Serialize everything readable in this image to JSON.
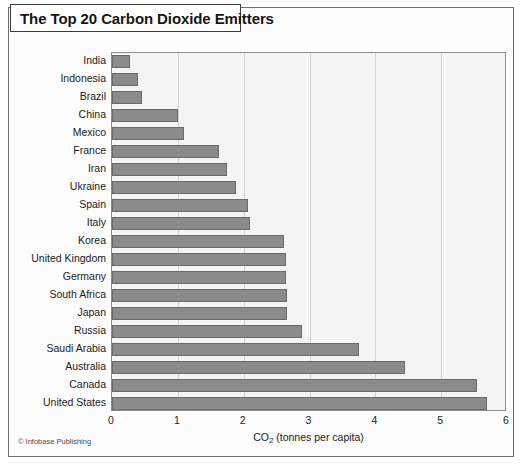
{
  "figure": {
    "title": "The Top 20 Carbon Dioxide Emitters",
    "credit": "© Infobase Publishing"
  },
  "colors": {
    "bar_fill": "#8b8b8b",
    "bar_border": "#6b6b6b",
    "plot_background": "#f4f4f4",
    "gridline": "#d3d3d3",
    "frame_border": "#6f6f6f",
    "title_border": "#3b3b3b",
    "text": "#1b1b1b"
  },
  "chart_data": {
    "type": "bar",
    "orientation": "horizontal",
    "title": "The Top 20 Carbon Dioxide Emitters",
    "xlabel": "CO2 (tonnes per capita)",
    "xlabel_parts": {
      "prefix": "CO",
      "subscript": "2",
      "suffix": " (tonnes per capita)"
    },
    "ylabel": "",
    "xlim": [
      0,
      6
    ],
    "xticks": [
      0,
      1,
      2,
      3,
      4,
      5,
      6
    ],
    "xticklabels": [
      "0",
      "1",
      "2",
      "3",
      "4",
      "5",
      "6"
    ],
    "grid": "vertical",
    "legend": "none",
    "categories": [
      "India",
      "Indonesia",
      "Brazil",
      "China",
      "Mexico",
      "France",
      "Iran",
      "Ukraine",
      "Spain",
      "Italy",
      "Korea",
      "United Kingdom",
      "Germany",
      "South Africa",
      "Japan",
      "Russia",
      "Saudi Arabia",
      "Australia",
      "Canada",
      "United States"
    ],
    "values": [
      0.28,
      0.39,
      0.45,
      1.0,
      1.1,
      1.63,
      1.75,
      1.89,
      2.07,
      2.09,
      2.62,
      2.65,
      2.65,
      2.66,
      2.66,
      2.88,
      3.75,
      4.45,
      5.55,
      5.7
    ]
  }
}
